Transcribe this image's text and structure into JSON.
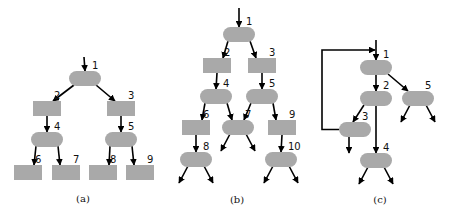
{
  "colors": {
    "node_fill": "#a9a9a9",
    "edge": "#000000",
    "label": "#111111"
  },
  "subfigures": [
    {
      "id": "a",
      "caption": "(a)",
      "nodes": [
        {
          "id": "1",
          "label": "1",
          "shape": "pill"
        },
        {
          "id": "2",
          "label": "2",
          "shape": "rect"
        },
        {
          "id": "3",
          "label": "3",
          "shape": "rect"
        },
        {
          "id": "4",
          "label": "4",
          "shape": "pill"
        },
        {
          "id": "5",
          "label": "5",
          "shape": "pill"
        },
        {
          "id": "6",
          "label": "6",
          "shape": "rect"
        },
        {
          "id": "7",
          "label": "7",
          "shape": "rect"
        },
        {
          "id": "8",
          "label": "8",
          "shape": "rect"
        },
        {
          "id": "9",
          "label": "9",
          "shape": "rect"
        }
      ],
      "edges": [
        {
          "from": "entry",
          "to": "1"
        },
        {
          "from": "1",
          "to": "2"
        },
        {
          "from": "1",
          "to": "3"
        },
        {
          "from": "2",
          "to": "4"
        },
        {
          "from": "3",
          "to": "5"
        },
        {
          "from": "4",
          "to": "6"
        },
        {
          "from": "4",
          "to": "7"
        },
        {
          "from": "5",
          "to": "8"
        },
        {
          "from": "5",
          "to": "9"
        }
      ]
    },
    {
      "id": "b",
      "caption": "(b)",
      "nodes": [
        {
          "id": "1",
          "label": "1",
          "shape": "pill"
        },
        {
          "id": "2",
          "label": "2",
          "shape": "rect"
        },
        {
          "id": "3",
          "label": "3",
          "shape": "rect"
        },
        {
          "id": "4",
          "label": "4",
          "shape": "pill"
        },
        {
          "id": "5",
          "label": "5",
          "shape": "pill"
        },
        {
          "id": "6",
          "label": "6",
          "shape": "rect"
        },
        {
          "id": "7",
          "label": "7",
          "shape": "pill"
        },
        {
          "id": "9",
          "label": "9",
          "shape": "rect"
        },
        {
          "id": "8",
          "label": "8",
          "shape": "pill"
        },
        {
          "id": "10",
          "label": "10",
          "shape": "pill"
        }
      ],
      "edges": [
        {
          "from": "entry",
          "to": "1"
        },
        {
          "from": "1",
          "to": "2"
        },
        {
          "from": "1",
          "to": "3"
        },
        {
          "from": "2",
          "to": "4"
        },
        {
          "from": "3",
          "to": "5"
        },
        {
          "from": "4",
          "to": "6"
        },
        {
          "from": "4",
          "to": "7"
        },
        {
          "from": "5",
          "to": "7"
        },
        {
          "from": "5",
          "to": "9"
        },
        {
          "from": "6",
          "to": "8"
        },
        {
          "from": "9",
          "to": "10"
        },
        {
          "from": "7",
          "to": "exit"
        },
        {
          "from": "7",
          "to": "exit"
        },
        {
          "from": "8",
          "to": "exit"
        },
        {
          "from": "8",
          "to": "exit"
        },
        {
          "from": "10",
          "to": "exit"
        },
        {
          "from": "10",
          "to": "exit"
        }
      ]
    },
    {
      "id": "c",
      "caption": "(c)",
      "nodes": [
        {
          "id": "1",
          "label": "1",
          "shape": "pill"
        },
        {
          "id": "2",
          "label": "2",
          "shape": "pill"
        },
        {
          "id": "5",
          "label": "5",
          "shape": "pill"
        },
        {
          "id": "3",
          "label": "3",
          "shape": "pill"
        },
        {
          "id": "4",
          "label": "4",
          "shape": "pill"
        }
      ],
      "edges": [
        {
          "from": "entry",
          "to": "1"
        },
        {
          "from": "1",
          "to": "2"
        },
        {
          "from": "1",
          "to": "5"
        },
        {
          "from": "2",
          "to": "3"
        },
        {
          "from": "2",
          "to": "4"
        },
        {
          "from": "3",
          "to": "1",
          "kind": "back-edge"
        },
        {
          "from": "3",
          "to": "exit"
        },
        {
          "from": "5",
          "to": "exit"
        },
        {
          "from": "5",
          "to": "exit"
        },
        {
          "from": "4",
          "to": "exit"
        },
        {
          "from": "4",
          "to": "exit"
        }
      ]
    }
  ]
}
